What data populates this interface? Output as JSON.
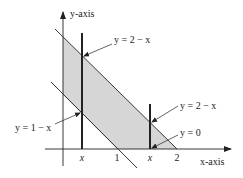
{
  "diagram": {
    "axes": {
      "x_label": "x-axis",
      "y_label": "y-axis"
    },
    "tick_labels": {
      "x1": "x",
      "one": "1",
      "x2": "x",
      "two": "2"
    },
    "annotations": {
      "upper_left": "y = 2 − x",
      "lower_left": "y = 1 − x",
      "upper_right": "y = 2 − x",
      "bottom_right": "y = 0"
    },
    "colors": {
      "shade": "#d6d6d6",
      "line": "#222222"
    }
  }
}
